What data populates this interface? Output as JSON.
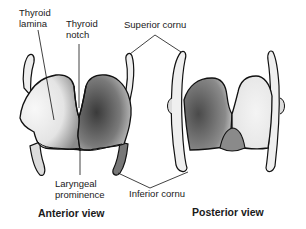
{
  "diagram": {
    "labels": {
      "thyroid_lamina": "Thyroid\nlamina",
      "thyroid_notch": "Thyroid\nnotch",
      "superior_cornu": "Superior cornu",
      "laryngeal_prominence": "Laryngeal\nprominence",
      "inferior_cornu": "Inferior cornu"
    },
    "captions": {
      "anterior": "Anterior view",
      "posterior": "Posterior view"
    },
    "colors": {
      "outline": "#111111",
      "light_fill": "#f2f2f2",
      "dark_shade": "#5a5a5a"
    }
  }
}
